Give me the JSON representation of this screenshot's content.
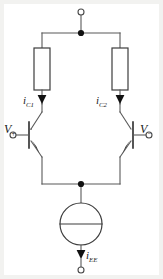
{
  "diagram": {
    "stroke_color": "#595959",
    "node_color": "#111111",
    "label_color": "#1a1a1a",
    "background": "#ffffff",
    "page_background": "#f2f2f0"
  },
  "labels": {
    "collector_current_left": {
      "symbol": "i",
      "subscript": "C1",
      "text": "iC1"
    },
    "collector_current_right": {
      "symbol": "i",
      "subscript": "C2",
      "text": "iC2"
    },
    "input_positive": {
      "symbol": "V",
      "sign": "+",
      "text": "V+"
    },
    "input_negative": {
      "symbol": "V",
      "sign": "−",
      "text": "V−"
    },
    "tail_current": {
      "symbol": "i",
      "subscript": "EE",
      "text": "iEE"
    }
  },
  "components": [
    {
      "name": "resistor-left",
      "type": "resistor",
      "style": "iec-box"
    },
    {
      "name": "resistor-right",
      "type": "resistor",
      "style": "iec-box"
    },
    {
      "name": "transistor-left",
      "type": "bjt-npn",
      "orientation": "normal"
    },
    {
      "name": "transistor-right",
      "type": "bjt-npn",
      "orientation": "mirrored"
    },
    {
      "name": "current-source-tail",
      "type": "current-source",
      "style": "circle-bar"
    }
  ],
  "terminals": [
    {
      "name": "supply-terminal-top",
      "style": "open-circle"
    },
    {
      "name": "base-terminal-left",
      "style": "open-circle"
    },
    {
      "name": "base-terminal-right",
      "style": "open-circle"
    },
    {
      "name": "tail-terminal-bottom",
      "style": "open-circle"
    }
  ],
  "junctions": [
    {
      "name": "junction-top-rail"
    },
    {
      "name": "junction-emitter-rail"
    }
  ]
}
